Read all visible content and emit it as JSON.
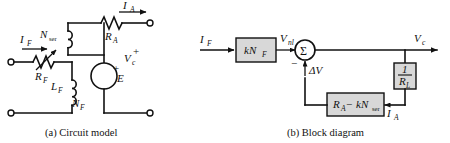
{
  "figure": {
    "background_color": "#ffffff",
    "line_color": "#111111",
    "block_fill": "#d8d8d8"
  },
  "panel_a": {
    "caption": "(a) Circuit model",
    "labels": {
      "field_current": "I",
      "field_current_sub": "F",
      "armature_current": "I",
      "armature_current_sub": "A",
      "series_turns": "N",
      "series_turns_sub": "ser",
      "field_resistance": "R",
      "field_resistance_sub": "F",
      "armature_resistance": "R",
      "armature_resistance_sub": "A",
      "field_inductance": "L",
      "field_inductance_sub": "F",
      "field_turns": "N",
      "field_turns_sub": "F",
      "emf_source": "E",
      "emf_plus": "+",
      "output_voltage": "V",
      "output_voltage_sub": "c",
      "output_plus": "+"
    },
    "components": [
      {
        "name": "variable-resistor",
        "symbol": "R_F",
        "type": "rheostat"
      },
      {
        "name": "series-field-winding",
        "symbol": "N_ser",
        "type": "coil"
      },
      {
        "name": "shunt-field-winding",
        "symbol": "L_F / N_F",
        "type": "coil"
      },
      {
        "name": "armature-resistance",
        "symbol": "R_A",
        "type": "resistor"
      },
      {
        "name": "emf-source",
        "symbol": "E",
        "type": "voltage-source"
      }
    ]
  },
  "panel_b": {
    "caption": "(b) Block diagram",
    "labels": {
      "input_current": "I",
      "input_current_sub": "F",
      "gain_block": "kN",
      "gain_block_sub": "F",
      "no_load_voltage": "V",
      "no_load_voltage_sub": "nl",
      "summer": "Σ",
      "minus_sign": "−",
      "delta_v": "ΔV",
      "output_voltage": "V",
      "output_voltage_sub": "c",
      "feedback_block_num": "1",
      "feedback_block_den": "R",
      "feedback_block_den_sub": "L",
      "armature_current": "I",
      "armature_current_sub": "A",
      "drop_block_a": "R",
      "drop_block_a_sub": "A",
      "drop_block_minus": "−",
      "drop_block_b": "kN",
      "drop_block_b_sub": "ser"
    },
    "blocks": [
      {
        "name": "gain-block",
        "text": "kN_F"
      },
      {
        "name": "summing-junction",
        "text": "Σ"
      },
      {
        "name": "load-admittance-block",
        "text": "1/R_L"
      },
      {
        "name": "voltage-drop-block",
        "text": "R_A − kN_ser"
      }
    ]
  }
}
